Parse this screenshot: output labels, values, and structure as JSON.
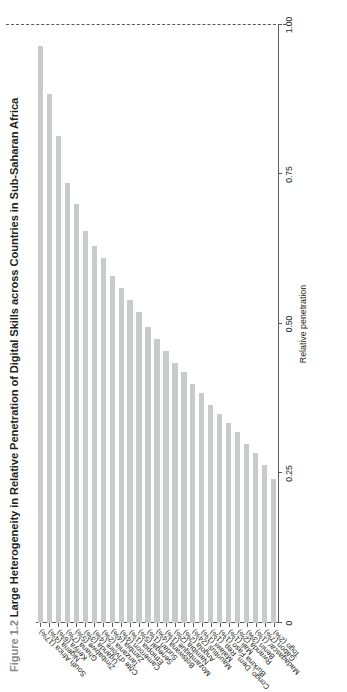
{
  "figure": {
    "number": "Figure 1.2",
    "title": "Large Heterogeneity in Relative Penetration of Digital Skills across Countries in Sub-Saharan Africa"
  },
  "chart_data": {
    "type": "bar",
    "orientation": "horizontal",
    "title": "Large Heterogeneity in Relative Penetration of Digital Skills across Countries in Sub-Saharan Africa",
    "xlabel": "",
    "ylabel": "Relative penetration",
    "ylim": [
      0,
      1.0
    ],
    "ytick_labels": [
      "0",
      "0.25",
      "0.50",
      "0.75",
      "1.00"
    ],
    "ytick_values": [
      0,
      0.25,
      0.5,
      0.75,
      1.0
    ],
    "axis_reversed": true,
    "grid": false,
    "legend": "none",
    "bar_color": "#c9cacb",
    "reference_line": {
      "label": "Global",
      "value": 1.0,
      "style": "dashed"
    },
    "categories": [
      "South Africa (17%)",
      "Nigeria (4%)",
      "Kenya (6%)",
      "Ghana (7%)",
      "Zimbabwe (5%)",
      "Uganda (3%)",
      "Côte d'Ivoire (4%)",
      "Tanzania (2%)",
      "Zambia (4%)",
      "Cameroon (4%)",
      "Ethiopia (1%)",
      "Senegal (5%)",
      "Sudan (1%)",
      "Botswana (4%)",
      "Mozambique (1%)",
      "Namibia (2%)",
      "Angola (2%)",
      "Mauritius (24%)",
      "Malawi (1%)",
      "Congo, Dem. Rep. (1%)",
      "Burkina Faso (1%)",
      "Mali (1%)",
      "Rwanda (2%)",
      "Benin (3%)",
      "Madagascar (1%)",
      "Gabon (7%)",
      "Togo (2%)"
    ],
    "values": [
      0.965,
      0.885,
      0.815,
      0.735,
      0.7,
      0.655,
      0.63,
      0.61,
      0.58,
      0.56,
      0.54,
      0.52,
      0.495,
      0.475,
      0.455,
      0.435,
      0.42,
      0.4,
      0.385,
      0.365,
      0.35,
      0.335,
      0.32,
      0.3,
      0.285,
      0.265,
      0.24
    ]
  }
}
